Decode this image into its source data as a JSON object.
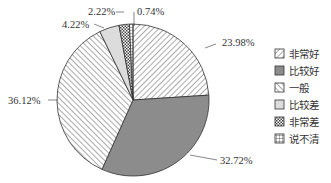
{
  "chart_data": {
    "type": "pie",
    "title": "",
    "legend_position": "right",
    "slices": [
      {
        "name": "非常好",
        "value": 23.98,
        "label": "23.98%",
        "pattern": "diag-back",
        "fill": "#ffffff"
      },
      {
        "name": "比较好",
        "value": 32.72,
        "label": "32.72%",
        "pattern": "solid",
        "fill": "#8c8c8c"
      },
      {
        "name": "一般",
        "value": 36.12,
        "label": "36.12%",
        "pattern": "diag-fwd",
        "fill": "#ffffff"
      },
      {
        "name": "比较差",
        "value": 4.22,
        "label": "4.22%",
        "pattern": "solid",
        "fill": "#dcdcdc"
      },
      {
        "name": "非常差",
        "value": 2.22,
        "label": "2.22%",
        "pattern": "checker",
        "fill": "#ffffff"
      },
      {
        "name": "说不清",
        "value": 0.74,
        "label": "0.74%",
        "pattern": "grid",
        "fill": "#ffffff"
      }
    ]
  }
}
